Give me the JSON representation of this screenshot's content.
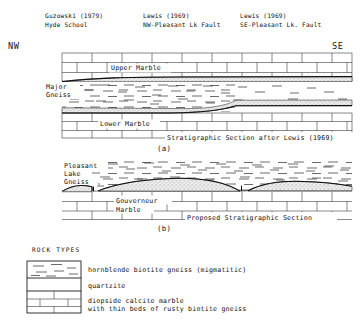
{
  "figure": {
    "title_note": "Stratigraphic cross-sections, Pleasant Lake area",
    "orientation_left": "NW",
    "orientation_right": "SE"
  },
  "column_headers": [
    {
      "source": "Guzowski (1979)",
      "locality": "Hyde School",
      "x": 45
    },
    {
      "source": "Lewis (1969)",
      "locality": "NW-Pleasant Lk Fault",
      "x": 143
    },
    {
      "source": "Lewis (1969)",
      "locality": "SE-Pleasant Lk. Fault",
      "x": 240
    }
  ],
  "sections": [
    {
      "id": "a",
      "panel_label": "(a)",
      "caption": "Stratigraphic Section after Lewis (1969)",
      "unit_labels": [
        {
          "text": "Upper Marble",
          "x": 113,
          "y": 70
        },
        {
          "text": "Major",
          "x": 47,
          "y": 88
        },
        {
          "text": "Gneiss",
          "x": 47,
          "y": 96
        },
        {
          "text": "Lower Marble",
          "x": 100,
          "y": 126
        }
      ]
    },
    {
      "id": "b",
      "panel_label": "(b)",
      "caption": "Proposed Stratigraphic Section",
      "unit_labels": [
        {
          "text": "Pleasant",
          "x": 64,
          "y": 167
        },
        {
          "text": "Lake",
          "x": 64,
          "y": 175
        },
        {
          "text": "Gneiss",
          "x": 64,
          "y": 183
        },
        {
          "text": "Gouverneur",
          "x": 117,
          "y": 202
        },
        {
          "text": "Marble",
          "x": 117,
          "y": 211
        }
      ]
    }
  ],
  "legend": {
    "title": "ROCK TYPES",
    "items": [
      {
        "pattern": "dash-gneiss",
        "label": "hornblende biotite gneiss (migmatitic)",
        "label2": ""
      },
      {
        "pattern": "stipple-quartzite",
        "label": "quartzite",
        "label2": ""
      },
      {
        "pattern": "brick-marble",
        "label": "diopside calcite marble",
        "label2": "with thin beds of rusty biotite gneiss"
      }
    ]
  }
}
